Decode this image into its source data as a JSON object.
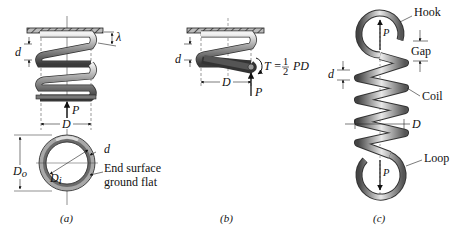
{
  "figure": {
    "panels": [
      {
        "id": "a",
        "caption": "(a)",
        "labels": {
          "wire_diameter": "d",
          "deflection": "λ",
          "load": "P",
          "mean_diameter": "D",
          "outer_diameter": "D",
          "outer_diameter_sub": "o",
          "inner_diameter": "D",
          "inner_diameter_sub": "i",
          "wire_diameter_end": "d",
          "end_note_line1": "End surface",
          "end_note_line2": "ground flat"
        }
      },
      {
        "id": "b",
        "caption": "(b)",
        "labels": {
          "wire_diameter": "d",
          "mean_diameter": "D",
          "load": "P",
          "torque_eq_lhs": "T =",
          "torque_num": "1",
          "torque_den": "2",
          "torque_rhs": "PD"
        }
      },
      {
        "id": "c",
        "caption": "(c)",
        "labels": {
          "hook": "Hook",
          "gap": "Gap",
          "coil": "Coil",
          "loop": "Loop",
          "wire_diameter": "d",
          "mean_diameter": "D",
          "load_top": "P",
          "load_bottom": "P"
        }
      }
    ]
  }
}
